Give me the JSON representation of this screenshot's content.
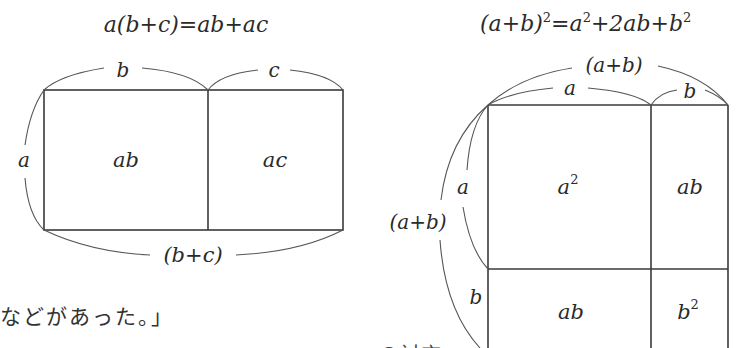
{
  "left_diagram": {
    "formula": "a(b+c)=ab+ac",
    "top_labels": [
      "b",
      "c"
    ],
    "side_label": "a",
    "bottom_label": "(b+c)",
    "cells": [
      "ab",
      "ac"
    ]
  },
  "right_diagram": {
    "formula": {
      "lhs": "(a+b)",
      "lhs_exp": "2",
      "eq": "=",
      "t1": "a",
      "t1_exp": "2",
      "t2": "+2ab+",
      "t3": "b",
      "t3_exp": "2"
    },
    "top_outer_label": "(a+b)",
    "top_labels": [
      "a",
      "b"
    ],
    "side_outer_label": "(a+b)",
    "side_labels": [
      "a",
      "b"
    ],
    "cells": {
      "top_left": {
        "base": "a",
        "exp": "2"
      },
      "top_right": "ab",
      "bottom_left": "ab",
      "bottom_right": {
        "base": "b",
        "exp": "2"
      }
    }
  },
  "text": {
    "caption": "などがあった。」",
    "caption_cut": "　　　　　　　　　　　　　　　　　　の対応"
  }
}
